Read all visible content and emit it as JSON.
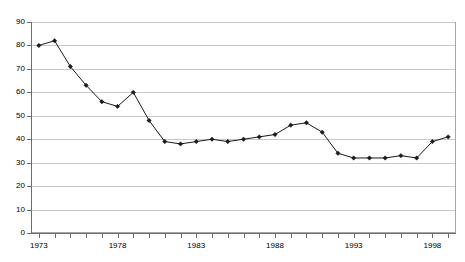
{
  "chart_data": {
    "type": "line",
    "title": "",
    "xlabel": "",
    "ylabel": "",
    "x": [
      1973,
      1974,
      1975,
      1976,
      1977,
      1978,
      1979,
      1980,
      1981,
      1982,
      1983,
      1984,
      1985,
      1986,
      1987,
      1988,
      1989,
      1990,
      1991,
      1992,
      1993,
      1994,
      1995,
      1996,
      1997,
      1998,
      1999
    ],
    "values": [
      80,
      82,
      71,
      63,
      56,
      54,
      60,
      48,
      39,
      38,
      39,
      40,
      39,
      40,
      41,
      42,
      46,
      47,
      43,
      34,
      32,
      32,
      32,
      33,
      32,
      39,
      41
    ],
    "series": [
      {
        "name": "series-1",
        "values": [
          80,
          82,
          71,
          63,
          56,
          54,
          60,
          48,
          39,
          38,
          39,
          40,
          39,
          40,
          41,
          42,
          46,
          47,
          43,
          34,
          32,
          32,
          32,
          33,
          32,
          39,
          41
        ]
      }
    ],
    "xlim": [
      1972.5,
      1999.5
    ],
    "ylim": [
      0,
      90
    ],
    "ytick_labels": [
      "0",
      "10",
      "20",
      "30",
      "40",
      "50",
      "60",
      "70",
      "80",
      "90"
    ],
    "ytick_values": [
      0,
      10,
      20,
      30,
      40,
      50,
      60,
      70,
      80,
      90
    ],
    "xtick_labels": [
      "1973",
      "1978",
      "1983",
      "1988",
      "1993",
      "1998"
    ],
    "xtick_values": [
      1973,
      1978,
      1983,
      1988,
      1993,
      1998
    ],
    "grid": "horizontal",
    "legend": "none",
    "marker": "diamond",
    "line_color": "#1a1a1a",
    "grid_color": "#c9c9c9",
    "axis_color": "#6e6e6e",
    "plot_border_color": "#a8a8a8",
    "background_color": "#ffffff"
  }
}
